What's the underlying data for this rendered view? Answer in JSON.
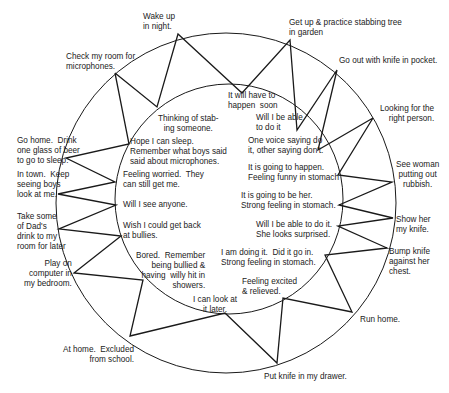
{
  "diagram": {
    "type": "cycle-zigzag",
    "outer_events": [
      {
        "id": "wake-up",
        "text": "Wake up\nin night.",
        "x": 178,
        "y": 34
      },
      {
        "id": "get-up",
        "text": "Get up & practice stabbing tree\nin garden",
        "x": 290,
        "y": 40
      },
      {
        "id": "go-out",
        "text": "Go out with knife in pocket.",
        "x": 337,
        "y": 70
      },
      {
        "id": "looking",
        "text": "Looking for the\nright person.",
        "x": 373,
        "y": 118
      },
      {
        "id": "see-woman",
        "text": "See woman\nputting out\nrubbish.",
        "x": 392,
        "y": 182
      },
      {
        "id": "show-her",
        "text": "Show her\nmy knife.",
        "x": 393,
        "y": 218
      },
      {
        "id": "bump-knife",
        "text": "Bump knife\nagainst her\nchest.",
        "x": 387,
        "y": 248
      },
      {
        "id": "run-home",
        "text": "Run home.",
        "x": 352,
        "y": 312
      },
      {
        "id": "put-knife",
        "text": "Put knife in my drawer.",
        "x": 277,
        "y": 363
      },
      {
        "id": "at-home",
        "text": "At home.  Excluded\nfrom school.",
        "x": 130,
        "y": 336
      },
      {
        "id": "play-on",
        "text": "Play on\ncomputer in\nmy bedroom.",
        "x": 74,
        "y": 273
      },
      {
        "id": "take-some",
        "text": "Take some\nof Dad's\ndrink to my\nroom for later",
        "x": 59,
        "y": 229
      },
      {
        "id": "in-town",
        "text": "In town.  Keep\nseeing boys\nlook at me.",
        "x": 58,
        "y": 194
      },
      {
        "id": "go-home",
        "text": "Go home.  Drink\none glass of beer\nto go to sleep.",
        "x": 66,
        "y": 158
      },
      {
        "id": "check-room",
        "text": "Check my room for\nmicrophones.",
        "x": 115,
        "y": 73
      }
    ],
    "inner_thoughts": [
      {
        "id": "thinking",
        "text": "Thinking of stab-\ning someone.",
        "x": 157,
        "y": 107
      },
      {
        "id": "will-have",
        "text": "It will have to\nhappen  soon",
        "x": 242,
        "y": 93
      },
      {
        "id": "will-i-be-able",
        "text": "Will I be able\nto do it",
        "x": 297,
        "y": 130
      },
      {
        "id": "one-voice",
        "text": "One voice saying do\nit, other saying don't.",
        "x": 318,
        "y": 150
      },
      {
        "id": "going-to-happen",
        "text": "It is going to happen.\nFeeling funny in stomach",
        "x": 338,
        "y": 175
      },
      {
        "id": "going-to-be-her",
        "text": "It is going to be her.\nStrong feeling in stomach.",
        "x": 339,
        "y": 205
      },
      {
        "id": "able-surprised",
        "text": "Will I be able to do it.\nShe looks surprised.",
        "x": 338,
        "y": 226
      },
      {
        "id": "doing-it",
        "text": "I am doing it.  Did it go in.\nStrong feeling in stomach.",
        "x": 325,
        "y": 255
      },
      {
        "id": "excited",
        "text": "Feeling excited\n& relieved.",
        "x": 283,
        "y": 298
      },
      {
        "id": "look-later",
        "text": "I can look at\nit later.",
        "x": 225,
        "y": 313
      },
      {
        "id": "bored",
        "text": "Bored.  Remember\nbeing bullied &\nhaving  willy hit in\nshowers.",
        "x": 143,
        "y": 280
      },
      {
        "id": "get-back",
        "text": "Wish I could get back\nat bullies.",
        "x": 121,
        "y": 236
      },
      {
        "id": "see-anyone",
        "text": "Will I see anyone.",
        "x": 116,
        "y": 205
      },
      {
        "id": "worried",
        "text": "Feeling worried.  They\ncan still get me.",
        "x": 115,
        "y": 182
      },
      {
        "id": "hope-sleep",
        "text": "Hope I can sleep.\nRemember what boys said\nsaid about microphones.",
        "x": 129,
        "y": 144
      }
    ],
    "zigzag_order": [
      "outer:check-room",
      "inner:thinking",
      "outer:wake-up",
      "inner:will-have",
      "outer:get-up",
      "inner:will-i-be-able",
      "outer:go-out",
      "inner:one-voice",
      "outer:looking",
      "inner:going-to-happen",
      "outer:see-woman",
      "inner:going-to-be-her",
      "outer:show-her",
      "inner:able-surprised",
      "outer:bump-knife",
      "inner:doing-it",
      "outer:run-home",
      "inner:excited",
      "outer:put-knife",
      "inner:look-later",
      "outer:at-home",
      "inner:bored",
      "outer:play-on",
      "inner:get-back",
      "outer:take-some",
      "inner:see-anyone",
      "outer:in-town",
      "inner:worried",
      "outer:go-home",
      "inner:hope-sleep",
      "outer:check-room"
    ],
    "outer_circle": {
      "cx": 226,
      "cy": 203,
      "rx": 170,
      "ry": 170
    },
    "inner_circle": {
      "cx": 229,
      "cy": 199,
      "rx": 114,
      "ry": 115
    },
    "stroke_color": "#1a1a1a",
    "labels": [
      {
        "key": "wake-up",
        "text": "Wake up\nin night.",
        "x": 143,
        "y": 12,
        "align": "left"
      },
      {
        "key": "get-up",
        "text": "Get up & practice stabbing tree\nin garden",
        "x": 289,
        "y": 18,
        "align": "left"
      },
      {
        "key": "go-out",
        "text": "Go out with knife in pocket.",
        "x": 339,
        "y": 56,
        "align": "left"
      },
      {
        "key": "looking",
        "text": "Looking for the\nright person.",
        "x": 380,
        "y": 104,
        "align": "right-edge"
      },
      {
        "key": "see-woman",
        "text": "See woman\nputting out\nrubbish.",
        "x": 396,
        "y": 160,
        "align": "center"
      },
      {
        "key": "show-her",
        "text": "Show her\nmy knife.",
        "x": 396,
        "y": 215,
        "align": "left"
      },
      {
        "key": "bump-knife",
        "text": "Bump knife\nagainst her\nchest.",
        "x": 389,
        "y": 247,
        "align": "left"
      },
      {
        "key": "run-home",
        "text": "Run home.",
        "x": 360,
        "y": 315,
        "align": "left"
      },
      {
        "key": "put-knife",
        "text": "Put knife in my drawer.",
        "x": 264,
        "y": 372,
        "align": "left"
      },
      {
        "key": "at-home",
        "text": "At home.  Excluded\nfrom school.",
        "x": 63,
        "y": 345,
        "align": "right"
      },
      {
        "key": "play-on",
        "text": "Play on\ncomputer in\nmy bedroom.",
        "x": 24,
        "y": 259,
        "align": "right"
      },
      {
        "key": "take-some",
        "text": "Take some\nof Dad's\ndrink to my\nroom for later",
        "x": 17,
        "y": 212,
        "align": "left"
      },
      {
        "key": "in-town",
        "text": "In town.  Keep\nseeing boys\nlook at me.",
        "x": 17,
        "y": 170,
        "align": "left"
      },
      {
        "key": "go-home",
        "text": "Go home.  Drink\none glass of beer\nto go to sleep.",
        "x": 17,
        "y": 136,
        "align": "left"
      },
      {
        "key": "check-room",
        "text": "Check my room for\nmicrophones.",
        "x": 66,
        "y": 52,
        "align": "left"
      },
      {
        "key": "thinking",
        "text": "Thinking of stab-\ning someone.",
        "x": 158,
        "y": 114,
        "align": "center"
      },
      {
        "key": "will-have",
        "text": "It will have to\nhappen  soon",
        "x": 228,
        "y": 91,
        "align": "left"
      },
      {
        "key": "will-i-be-able",
        "text": "Will I be able\nto do it",
        "x": 256,
        "y": 113,
        "align": "left"
      },
      {
        "key": "one-voice",
        "text": "One voice saying do\nit, other saying don't.",
        "x": 248,
        "y": 136,
        "align": "left"
      },
      {
        "key": "going-to-happen",
        "text": "It is going to happen.\nFeeling funny in stomach",
        "x": 248,
        "y": 163,
        "align": "left"
      },
      {
        "key": "going-to-be-her",
        "text": "It is going to be her.\nStrong feeling in stomach.",
        "x": 241,
        "y": 191,
        "align": "left"
      },
      {
        "key": "able-surprised",
        "text": "Will I be able to do it.\nShe looks surprised.",
        "x": 256,
        "y": 220,
        "align": "left"
      },
      {
        "key": "doing-it",
        "text": "I am doing it.  Did it go in.\nStrong feeling in stomach.",
        "x": 221,
        "y": 248,
        "align": "left"
      },
      {
        "key": "excited",
        "text": "Feeling excited\n& relieved.",
        "x": 242,
        "y": 277,
        "align": "left"
      },
      {
        "key": "look-later",
        "text": "I can look at\nit later.",
        "x": 193,
        "y": 295,
        "align": "center"
      },
      {
        "key": "bored",
        "text": "Bored.  Remember\nbeing bullied &\nhaving  willy hit in\nshowers.",
        "x": 136,
        "y": 251,
        "align": "right"
      },
      {
        "key": "get-back",
        "text": "Wish I could get back\nat bullies.",
        "x": 123,
        "y": 221,
        "align": "left"
      },
      {
        "key": "see-anyone",
        "text": "Will I see anyone.",
        "x": 123,
        "y": 200,
        "align": "left"
      },
      {
        "key": "worried",
        "text": "Feeling worried.  They\ncan still get me.",
        "x": 123,
        "y": 170,
        "align": "left"
      },
      {
        "key": "hope-sleep",
        "text": "Hope I can sleep.\nRemember what boys said\nsaid about microphones.",
        "x": 130,
        "y": 137,
        "align": "left"
      }
    ]
  }
}
